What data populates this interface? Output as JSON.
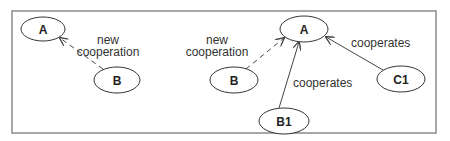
{
  "diagram": {
    "title": "",
    "frame": {
      "x": 12,
      "y": 11,
      "width": 424,
      "height": 122,
      "color": "#8a8a8a"
    },
    "left_panel": {
      "nodes": [
        {
          "id": "A",
          "label": "A",
          "cx": 43,
          "cy": 29,
          "rx": 22,
          "ry": 12
        },
        {
          "id": "B",
          "label": "B",
          "cx": 117,
          "cy": 80,
          "rx": 23,
          "ry": 13
        }
      ],
      "edges": [
        {
          "from": "B",
          "to": "A",
          "style": "dashed",
          "label": "new\ncooperation",
          "label_lines": [
            "new",
            "cooperation"
          ]
        }
      ]
    },
    "right_panel": {
      "nodes": [
        {
          "id": "A",
          "label": "A",
          "cx": 304,
          "cy": 29,
          "rx": 24,
          "ry": 13
        },
        {
          "id": "B",
          "label": "B",
          "cx": 234,
          "cy": 80,
          "rx": 24,
          "ry": 13
        },
        {
          "id": "B1",
          "label": "B1",
          "cx": 284,
          "cy": 121,
          "rx": 25,
          "ry": 13
        },
        {
          "id": "C1",
          "label": "C1",
          "cx": 401,
          "cy": 79,
          "rx": 24,
          "ry": 13
        }
      ],
      "edges": [
        {
          "from": "B",
          "to": "A",
          "style": "dashed",
          "label": "new\ncooperation",
          "label_lines": [
            "new",
            "cooperation"
          ]
        },
        {
          "from": "B1",
          "to": "A",
          "style": "solid",
          "label": "cooperates"
        },
        {
          "from": "C1",
          "to": "A",
          "style": "solid",
          "label": "cooperates"
        }
      ]
    }
  },
  "labels": {
    "left_A": "A",
    "left_B": "B",
    "left_edge_line1": "new",
    "left_edge_line2": "cooperation",
    "right_A": "A",
    "right_B": "B",
    "right_B1": "B1",
    "right_C1": "C1",
    "right_edge_new_line1": "new",
    "right_edge_new_line2": "cooperation",
    "right_edge_b1": "cooperates",
    "right_edge_c1": "cooperates"
  }
}
